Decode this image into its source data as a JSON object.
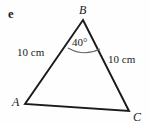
{
  "figure": {
    "part_label": "e",
    "vertices": [
      {
        "name": "B",
        "label": "B",
        "x": 83,
        "y": 20
      },
      {
        "name": "A",
        "label": "A",
        "x": 25,
        "y": 104
      },
      {
        "name": "C",
        "label": "C",
        "x": 129,
        "y": 111
      }
    ],
    "angle": {
      "at_vertex": "B",
      "label": "40°",
      "value": 40,
      "unit": "degrees"
    },
    "sides": [
      {
        "from": "A",
        "to": "B",
        "label": "10 cm",
        "length": 10,
        "unit": "cm"
      },
      {
        "from": "B",
        "to": "C",
        "label": "10 cm",
        "length": 10,
        "unit": "cm"
      },
      {
        "from": "A",
        "to": "C",
        "label": "",
        "length": null,
        "unit": ""
      }
    ],
    "stroke_color": "#1a1a1a",
    "background_color": "#fefefe",
    "arc_color": "#555555"
  }
}
